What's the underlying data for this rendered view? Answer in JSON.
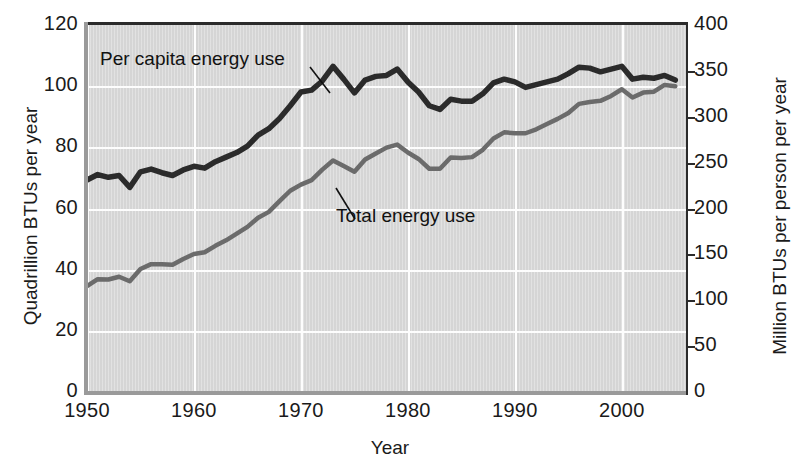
{
  "chart_data": {
    "type": "line",
    "title": "",
    "xlabel": "Year",
    "ylabel": "Quadrillion BTUs per year",
    "ylabel_right": "Million BTUs per person per year",
    "xlim": [
      1950,
      2006
    ],
    "ylim": [
      0,
      120
    ],
    "ylim_right": [
      0,
      400
    ],
    "xticks": [
      1950,
      1960,
      1970,
      1980,
      1990,
      2000
    ],
    "xticklabels": [
      "1950",
      "1960",
      "1970",
      "1980",
      "1990",
      "2000"
    ],
    "yticks": [
      0,
      20,
      40,
      60,
      80,
      100,
      120
    ],
    "yticklabels": [
      "0",
      "20",
      "40",
      "60",
      "80",
      "100",
      "120"
    ],
    "yticks_right": [
      0,
      50,
      100,
      150,
      200,
      250,
      300,
      350,
      400
    ],
    "yticklabels_right": [
      "0",
      "50",
      "100",
      "150",
      "200",
      "250",
      "300",
      "350",
      "400"
    ],
    "grid": true,
    "legend_position": "inline-annotations",
    "plot_background": "#d5d5d5",
    "gridline_color": "#fdfdfd",
    "series": [
      {
        "name": "Per capita energy use",
        "axis": "right",
        "color": "#2b2b2b",
        "unit": "Million BTUs per person per year",
        "x": [
          1950,
          1951,
          1952,
          1953,
          1954,
          1955,
          1956,
          1957,
          1958,
          1959,
          1960,
          1961,
          1962,
          1963,
          1964,
          1965,
          1966,
          1967,
          1968,
          1969,
          1970,
          1971,
          1972,
          1973,
          1974,
          1975,
          1976,
          1977,
          1978,
          1979,
          1980,
          1981,
          1982,
          1983,
          1984,
          1985,
          1986,
          1987,
          1988,
          1989,
          1990,
          1991,
          1992,
          1993,
          1994,
          1995,
          1996,
          1997,
          1998,
          1999,
          2000,
          2001,
          2002,
          2003,
          2004,
          2005
        ],
        "values": [
          231,
          237,
          234,
          236,
          223,
          240,
          243,
          239,
          236,
          242,
          246,
          244,
          251,
          256,
          261,
          268,
          280,
          287,
          298,
          312,
          327,
          329,
          339,
          355,
          341,
          326,
          340,
          344,
          345,
          352,
          338,
          327,
          312,
          308,
          319,
          317,
          317,
          325,
          337,
          341,
          338,
          332,
          335,
          338,
          341,
          347,
          354,
          353,
          349,
          352,
          355,
          341,
          343,
          342,
          345,
          340
        ]
      },
      {
        "name": "Total energy use",
        "axis": "left",
        "color": "#6b6b6b",
        "unit": "Quadrillion BTUs per year",
        "x": [
          1950,
          1951,
          1952,
          1953,
          1954,
          1955,
          1956,
          1957,
          1958,
          1959,
          1960,
          1961,
          1962,
          1963,
          1964,
          1965,
          1966,
          1967,
          1968,
          1969,
          1970,
          1971,
          1972,
          1973,
          1974,
          1975,
          1976,
          1977,
          1978,
          1979,
          1980,
          1981,
          1982,
          1983,
          1984,
          1985,
          1986,
          1987,
          1988,
          1989,
          1990,
          1991,
          1992,
          1993,
          1994,
          1995,
          1996,
          1997,
          1998,
          1999,
          2000,
          2001,
          2002,
          2003,
          2004,
          2005
        ],
        "values": [
          34.6,
          36.9,
          36.8,
          37.7,
          36.2,
          40.2,
          41.8,
          41.8,
          41.6,
          43.5,
          45.1,
          45.7,
          47.8,
          49.6,
          51.8,
          54.0,
          57.0,
          58.9,
          62.4,
          65.8,
          67.8,
          69.3,
          72.7,
          75.7,
          73.9,
          72.0,
          76.0,
          78.0,
          79.9,
          80.9,
          78.3,
          76.2,
          73.0,
          73.0,
          76.7,
          76.5,
          76.8,
          79.2,
          82.9,
          84.9,
          84.6,
          84.6,
          85.9,
          87.6,
          89.3,
          91.2,
          94.2,
          94.8,
          95.2,
          96.8,
          99.0,
          96.3,
          97.9,
          98.2,
          100.4,
          100.0
        ]
      }
    ],
    "annotations": [
      {
        "text": "Per capita energy use",
        "series": "Per capita energy use",
        "x": 1950,
        "y": 110
      },
      {
        "text": "Total energy use",
        "series": "Total energy use",
        "x": 1971,
        "y": 52
      }
    ]
  },
  "axes": {
    "left": {
      "title": "Quadrillion BTUs per year",
      "ticks": [
        {
          "label": "120",
          "value": 120
        },
        {
          "label": "100",
          "value": 100
        },
        {
          "label": "80",
          "value": 80
        },
        {
          "label": "60",
          "value": 60
        },
        {
          "label": "40",
          "value": 40
        },
        {
          "label": "20",
          "value": 20
        },
        {
          "label": "0",
          "value": 0
        }
      ]
    },
    "right": {
      "title": "Million BTUs per person per year",
      "ticks": [
        {
          "label": "400",
          "value": 400
        },
        {
          "label": "350",
          "value": 350
        },
        {
          "label": "300",
          "value": 300
        },
        {
          "label": "250",
          "value": 250
        },
        {
          "label": "200",
          "value": 200
        },
        {
          "label": "150",
          "value": 150
        },
        {
          "label": "100",
          "value": 100
        },
        {
          "label": "50",
          "value": 50
        },
        {
          "label": "0",
          "value": 0
        }
      ]
    },
    "bottom": {
      "title": "Year",
      "ticks": [
        {
          "label": "1950",
          "value": 1950
        },
        {
          "label": "1960",
          "value": 1960
        },
        {
          "label": "1970",
          "value": 1970
        },
        {
          "label": "1980",
          "value": 1980
        },
        {
          "label": "1990",
          "value": 1990
        },
        {
          "label": "2000",
          "value": 2000
        }
      ]
    }
  },
  "labels": {
    "per_capita": "Per capita energy use",
    "total": "Total energy use"
  }
}
